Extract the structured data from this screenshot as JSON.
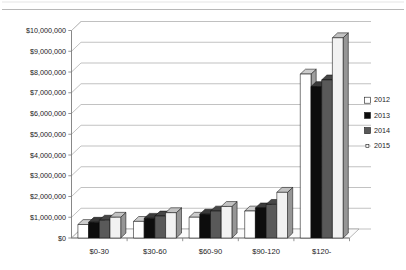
{
  "chart_data": {
    "type": "bar",
    "title": "",
    "subtitle": "",
    "xlabel": "",
    "ylabel": "",
    "grid": true,
    "legend_position": "right",
    "ylim": [
      0,
      10000000
    ],
    "ytick_step": 1000000,
    "ytick_labels": [
      "$10,000,000",
      "$9,000,000",
      "$8,000,000",
      "$7,000,000",
      "$6,000,000",
      "$5,000,000",
      "$4,000,000",
      "$3,000,000",
      "$2,000,000",
      "$1,000,000",
      "$0"
    ],
    "categories": [
      "$0-30",
      "$30-60",
      "$60-90",
      "$90-120",
      "$120-"
    ],
    "series": [
      {
        "name": "2012",
        "color": "#ffffff",
        "values": [
          650000,
          800000,
          1000000,
          1300000,
          7900000
        ]
      },
      {
        "name": "2013",
        "color": "#0d0d0d",
        "values": [
          760000,
          950000,
          1150000,
          1450000,
          7300000
        ]
      },
      {
        "name": "2014",
        "color": "#595959",
        "values": [
          860000,
          1060000,
          1300000,
          1620000,
          7620000
        ]
      },
      {
        "name": "2015",
        "color": "#f2f2f2",
        "values": [
          1000000,
          1220000,
          1520000,
          2200000,
          9650000
        ]
      }
    ]
  },
  "legend": {
    "entries": [
      {
        "label": "2012",
        "swatch": "#ffffff"
      },
      {
        "label": "2013",
        "swatch": "#0d0d0d"
      },
      {
        "label": "2014",
        "swatch": "#595959"
      },
      {
        "label": "2015",
        "swatch": "#f7f7f7"
      }
    ]
  }
}
